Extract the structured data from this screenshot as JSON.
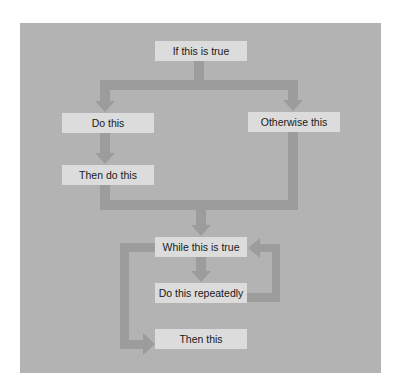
{
  "colors": {
    "panel": "#b3b3b3",
    "box": "#dcdcdc",
    "arrow": "#9c9c9c",
    "text": "#1a1a1a"
  },
  "diagram": {
    "type": "flowchart",
    "nodes": [
      {
        "id": "if",
        "label": "If this is true"
      },
      {
        "id": "do",
        "label": "Do this"
      },
      {
        "id": "otherwise",
        "label": "Otherwise this"
      },
      {
        "id": "then_do",
        "label": "Then do this"
      },
      {
        "id": "while",
        "label": "While this is true"
      },
      {
        "id": "repeat",
        "label": "Do this repeatedly"
      },
      {
        "id": "then",
        "label": "Then this"
      }
    ],
    "edges": [
      {
        "from": "if",
        "to": "do"
      },
      {
        "from": "if",
        "to": "otherwise"
      },
      {
        "from": "do",
        "to": "then_do"
      },
      {
        "from": "then_do",
        "to": "while"
      },
      {
        "from": "otherwise",
        "to": "while"
      },
      {
        "from": "while",
        "to": "repeat"
      },
      {
        "from": "repeat",
        "to": "while"
      },
      {
        "from": "while",
        "to": "then"
      }
    ]
  }
}
